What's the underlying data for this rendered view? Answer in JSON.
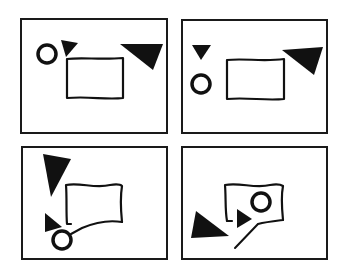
{
  "figure": {
    "layout": "2x2 grid of panels",
    "colors": {
      "background": "#ffffff",
      "ink": "#111111"
    },
    "panels": [
      {
        "id": "top-left",
        "frame": [
          21,
          19,
          146,
          114
        ],
        "shapes": {
          "circle": {
            "cx": 47,
            "cy": 54,
            "r": 9
          },
          "small_triangle": {
            "points": "61,40 78,43 66,57",
            "direction": "down"
          },
          "large_triangle": {
            "points": "120,44 163,44 153,70",
            "direction": "down-right"
          },
          "flag_rect": {
            "path": "M67,59 C82,57 100,60 123,58 L123,98 C105,100 90,96 67,98 Z"
          }
        }
      },
      {
        "id": "top-right",
        "frame": [
          182,
          20,
          145,
          113
        ],
        "shapes": {
          "circle": {
            "cx": 201,
            "cy": 84,
            "r": 9
          },
          "small_triangle": {
            "points": "192,45 211,45 201,60",
            "direction": "down"
          },
          "large_triangle": {
            "points": "282,50 323,47 314,75",
            "direction": "down-right"
          },
          "flag_rect": {
            "path": "M227,60 C245,58 262,62 284,59 L284,99 C265,101 248,97 227,99 Z"
          }
        }
      },
      {
        "id": "bottom-left",
        "frame": [
          22,
          147,
          145,
          112
        ],
        "shapes": {
          "circle": {
            "cx": 62,
            "cy": 240,
            "r": 9
          },
          "small_triangle": {
            "points": "45,213 45,232 62,227",
            "direction": "right"
          },
          "large_triangle": {
            "points": "43,154 71,159 51,197",
            "direction": "down"
          },
          "flag_rect": {
            "path": "M66,185 C80,182 95,189 110,185 C116,184 120,184 122,186 C120,198 121,212 122,222 C108,219 95,224 82,226 L72,233 M66,185 C67,198 66,212 67,224 L71,224"
          },
          "connector": {
            "path": "M71,234 L82,228 C96,222 110,220 122,222"
          }
        }
      },
      {
        "id": "bottom-right",
        "frame": [
          182,
          147,
          145,
          112
        ],
        "shapes": {
          "circle": {
            "cx": 261,
            "cy": 202,
            "r": 9
          },
          "small_triangle": {
            "points": "237,209 237,228 252,219",
            "direction": "right"
          },
          "large_triangle": {
            "points": "196,211 191,238 229,236",
            "direction": "right"
          },
          "flag_rect": {
            "path": "M225,185 C240,182 255,189 270,185 C276,184 280,184 283,186 C281,196 282,210 283,220 M225,185 C226,197 225,210 227,221 L232,221"
          },
          "connector": {
            "path": "M235,248 L258,224 C266,222 275,221 283,220"
          }
        }
      }
    ]
  }
}
